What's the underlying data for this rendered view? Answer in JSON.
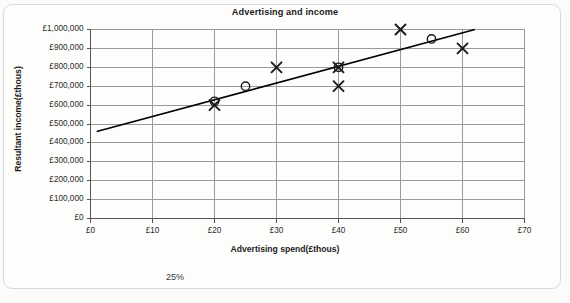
{
  "card": {
    "footnote": "25%"
  },
  "chart_data": {
    "type": "scatter",
    "title": "Advertising and income",
    "xlabel": "Advertising spend(£thous)",
    "ylabel": "Resultant income(£thous)",
    "xlim": [
      0,
      70
    ],
    "ylim": [
      0,
      1000000
    ],
    "grid": true,
    "legend": "none",
    "xticks": [
      0,
      10,
      20,
      30,
      40,
      50,
      60,
      70
    ],
    "xtick_labels": [
      "£0",
      "£10",
      "£20",
      "£30",
      "£40",
      "£50",
      "£60",
      "£70"
    ],
    "yticks": [
      0,
      100000,
      200000,
      300000,
      400000,
      500000,
      600000,
      700000,
      800000,
      900000,
      1000000
    ],
    "ytick_labels": [
      "£0",
      "£100,000",
      "£200,000",
      "£300,000",
      "£400,000",
      "£500,000",
      "£600,000",
      "£700,000",
      "£800,000",
      "£900,000",
      "£1,000,000"
    ],
    "series": [
      {
        "name": "Observed data",
        "marker": "cross",
        "color": "#1a1a1a",
        "points": [
          {
            "x": 20,
            "y": 600000
          },
          {
            "x": 30,
            "y": 800000
          },
          {
            "x": 40,
            "y": 700000
          },
          {
            "x": 40,
            "y": 800000
          },
          {
            "x": 50,
            "y": 1000000
          },
          {
            "x": 60,
            "y": 900000
          }
        ]
      },
      {
        "name": "Predicted data",
        "marker": "circle",
        "color": "#1a1a1a",
        "points": [
          {
            "x": 20,
            "y": 620000
          },
          {
            "x": 25,
            "y": 700000
          },
          {
            "x": 40,
            "y": 800000
          },
          {
            "x": 55,
            "y": 950000
          }
        ]
      }
    ],
    "trendline": {
      "name": "Line of best fit",
      "color": "#000000",
      "x_start": 1,
      "y_start": 460000,
      "x_end": 62,
      "y_end": 1000000
    }
  }
}
